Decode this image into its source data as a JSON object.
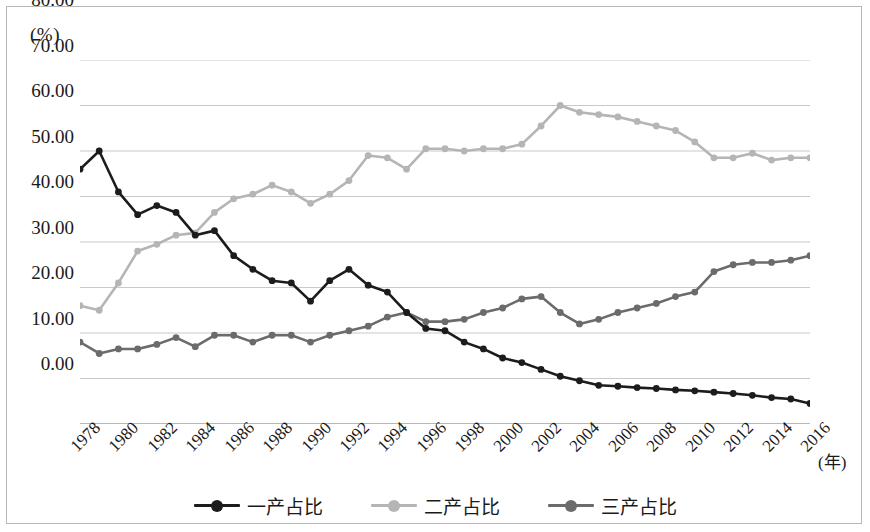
{
  "axis": {
    "unit_label": "(%)",
    "x_unit_label": "(年)",
    "y_ticks": [
      "80.00",
      "70.00",
      "60.00",
      "50.00",
      "40.00",
      "30.00",
      "20.00",
      "10.00",
      "0.00"
    ],
    "x_ticks": [
      "1978",
      "1980",
      "1982",
      "1984",
      "1986",
      "1988",
      "1990",
      "1992",
      "1994",
      "1996",
      "1998",
      "2000",
      "2002",
      "2004",
      "2006",
      "2008",
      "2010",
      "2012",
      "2014",
      "2016"
    ]
  },
  "legend": {
    "items": [
      {
        "label": "一产占比",
        "color": "#1c1c1c"
      },
      {
        "label": "二产占比",
        "color": "#b5b5b5"
      },
      {
        "label": "三产占比",
        "color": "#6b6b6b"
      }
    ]
  },
  "colors": {
    "primary_sector": "#1c1c1c",
    "secondary_sector": "#b5b5b5",
    "tertiary_sector": "#6b6b6b",
    "gridline": "#c9c9c9",
    "frame": "#b9b9b9",
    "background": "#ffffff"
  },
  "chart_data": {
    "type": "line",
    "title": "",
    "xlabel": "(年)",
    "ylabel": "(%)",
    "xlim": [
      1978,
      2016
    ],
    "ylim": [
      0,
      80
    ],
    "ytick_step": 10,
    "xtick_step": 2,
    "grid": true,
    "legend_position": "bottom",
    "x": [
      1978,
      1979,
      1980,
      1981,
      1982,
      1983,
      1984,
      1985,
      1986,
      1987,
      1988,
      1989,
      1990,
      1991,
      1992,
      1993,
      1994,
      1995,
      1996,
      1997,
      1998,
      1999,
      2000,
      2001,
      2002,
      2003,
      2004,
      2005,
      2006,
      2007,
      2008,
      2009,
      2010,
      2011,
      2012,
      2013,
      2014,
      2015,
      2016
    ],
    "series": [
      {
        "name": "一产占比",
        "color": "#1c1c1c",
        "values": [
          56.0,
          60.0,
          51.0,
          46.0,
          48.0,
          46.5,
          41.5,
          42.5,
          37.0,
          34.0,
          31.5,
          31.0,
          27.0,
          31.5,
          34.0,
          30.5,
          29.0,
          24.5,
          21.0,
          20.5,
          18.0,
          16.5,
          14.5,
          13.5,
          12.0,
          10.5,
          9.5,
          8.5,
          8.3,
          8.0,
          7.8,
          7.5,
          7.3,
          7.0,
          6.7,
          6.3,
          5.8,
          5.5,
          4.5
        ]
      },
      {
        "name": "二产占比",
        "color": "#b5b5b5",
        "values": [
          26.0,
          25.0,
          31.0,
          38.0,
          39.5,
          41.5,
          42.0,
          46.5,
          49.5,
          50.5,
          52.5,
          51.0,
          48.5,
          50.5,
          53.5,
          59.0,
          58.5,
          56.0,
          60.5,
          60.5,
          60.0,
          60.5,
          60.5,
          61.5,
          65.5,
          70.0,
          68.5,
          68.0,
          67.5,
          66.5,
          65.5,
          64.5,
          62.0,
          58.5,
          58.5,
          59.5,
          58.0,
          58.5,
          58.5
        ]
      },
      {
        "name": "三产占比",
        "color": "#6b6b6b",
        "values": [
          18.0,
          15.5,
          16.5,
          16.5,
          17.5,
          19.0,
          17.0,
          19.5,
          19.5,
          18.0,
          19.5,
          19.5,
          18.0,
          19.5,
          20.5,
          21.5,
          23.5,
          24.5,
          22.5,
          22.5,
          23.0,
          24.5,
          25.5,
          27.5,
          28.0,
          24.5,
          22.0,
          23.0,
          24.5,
          25.5,
          26.5,
          28.0,
          29.0,
          33.5,
          35.0,
          35.5,
          35.5,
          36.0,
          37.0
        ]
      }
    ]
  }
}
